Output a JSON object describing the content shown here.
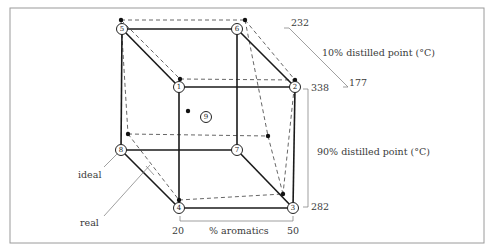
{
  "figure": {
    "frame": {
      "x": 10,
      "y": 8,
      "width": 474,
      "height": 235,
      "border_color": "#9a9a9a"
    },
    "axes": {
      "x_axis": {
        "label": "% aromatics",
        "min_label": "20",
        "max_label": "50"
      },
      "y_axis": {
        "label": "90% distilled point (°C)",
        "max_label": "338",
        "min_label": "282"
      },
      "z_axis": {
        "label": "10% distilled point (°C)",
        "max_label": "232",
        "min_label": "177"
      }
    },
    "nodes": [
      {
        "id": "1",
        "label": "1",
        "x": 179,
        "y": 87
      },
      {
        "id": "2",
        "label": "2",
        "x": 295,
        "y": 87
      },
      {
        "id": "3",
        "label": "3",
        "x": 293,
        "y": 208
      },
      {
        "id": "4",
        "label": "4",
        "x": 179,
        "y": 208
      },
      {
        "id": "5",
        "label": "5",
        "x": 122,
        "y": 29
      },
      {
        "id": "6",
        "label": "6",
        "x": 237,
        "y": 29
      },
      {
        "id": "7",
        "label": "7",
        "x": 237,
        "y": 150
      },
      {
        "id": "8",
        "label": "8",
        "x": 121,
        "y": 150
      },
      {
        "id": "9",
        "label": "9",
        "x": 206,
        "y": 117
      }
    ],
    "real_points": [
      {
        "near": "5",
        "x": 121,
        "y": 20
      },
      {
        "near": "6",
        "x": 245,
        "y": 20
      },
      {
        "near": "1",
        "x": 180,
        "y": 79
      },
      {
        "near": "2",
        "x": 295,
        "y": 80
      },
      {
        "near": "9",
        "x": 188,
        "y": 111
      },
      {
        "near": "8",
        "x": 128,
        "y": 134
      },
      {
        "near": "7",
        "x": 268,
        "y": 136
      },
      {
        "near": "3",
        "x": 283,
        "y": 194
      },
      {
        "near": "4",
        "x": 179,
        "y": 200
      }
    ],
    "annotations": {
      "ideal_label": "ideal",
      "real_label": "real"
    },
    "colors": {
      "ideal_line": "#1a1a1a",
      "real_line": "#555555",
      "text": "#3a3a3a"
    }
  }
}
